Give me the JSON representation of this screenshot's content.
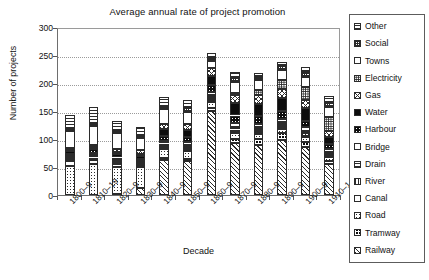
{
  "chart_data": {
    "type": "bar",
    "subtype": "stacked-bar",
    "title": "Average annual rate of project promotion",
    "xlabel": "Decade",
    "ylabel": "Number of projects",
    "ylim": [
      0,
      300
    ],
    "ytick_step": 50,
    "yticks": [
      300,
      250,
      200,
      150,
      100,
      50,
      0
    ],
    "grid": true,
    "grid_style": "dotted horizontal",
    "legend_position": "right-outside",
    "legend_order_top_to_bottom": [
      "Other",
      "Social",
      "Towns",
      "Electricity",
      "Gas",
      "Water",
      "Harbour",
      "Bridge",
      "Drain",
      "River",
      "Canal",
      "Road",
      "Tramway",
      "Railway"
    ],
    "categories": [
      "1800–9",
      "1810–19",
      "1820–9",
      "1830–9",
      "1840–9",
      "1850–9",
      "1860–9",
      "1870–9",
      "1880–9",
      "1890–9",
      "1900–9",
      "1910–14"
    ],
    "series": [
      {
        "name": "Railway",
        "pattern": "p-diag",
        "values": [
          0,
          0,
          2,
          12,
          62,
          60,
          150,
          92,
          90,
          98,
          86,
          55
        ]
      },
      {
        "name": "Tramway",
        "pattern": "p-blackgrid",
        "values": [
          0,
          0,
          0,
          0,
          4,
          5,
          6,
          8,
          10,
          12,
          9,
          6
        ]
      },
      {
        "name": "Road",
        "pattern": "p-dot",
        "values": [
          52,
          55,
          48,
          38,
          16,
          14,
          10,
          10,
          9,
          8,
          8,
          7
        ]
      },
      {
        "name": "Canal",
        "pattern": "p-white",
        "values": [
          9,
          8,
          6,
          4,
          3,
          3,
          3,
          3,
          3,
          3,
          3,
          2
        ]
      },
      {
        "name": "River",
        "pattern": "p-vline",
        "values": [
          4,
          4,
          3,
          3,
          3,
          3,
          4,
          4,
          4,
          4,
          4,
          3
        ]
      },
      {
        "name": "Drain",
        "pattern": "p-hline",
        "values": [
          4,
          4,
          4,
          3,
          4,
          4,
          5,
          5,
          5,
          5,
          5,
          4
        ]
      },
      {
        "name": "Bridge",
        "pattern": "p-white",
        "values": [
          4,
          4,
          4,
          4,
          5,
          5,
          6,
          6,
          6,
          6,
          6,
          5
        ]
      },
      {
        "name": "Harbour",
        "pattern": "p-blackdot",
        "values": [
          6,
          7,
          6,
          6,
          9,
          9,
          12,
          14,
          14,
          14,
          12,
          9
        ]
      },
      {
        "name": "Water",
        "pattern": "p-solid",
        "values": [
          3,
          4,
          4,
          4,
          11,
          13,
          17,
          23,
          22,
          24,
          22,
          13
        ]
      },
      {
        "name": "Gas",
        "pattern": "p-cross",
        "values": [
          2,
          3,
          5,
          6,
          10,
          11,
          13,
          14,
          16,
          16,
          14,
          10
        ]
      },
      {
        "name": "Electricity",
        "pattern": "p-dot-dense",
        "values": [
          0,
          0,
          0,
          0,
          0,
          0,
          0,
          4,
          9,
          16,
          24,
          26
        ]
      },
      {
        "name": "Towns",
        "pattern": "p-white",
        "values": [
          30,
          34,
          28,
          22,
          26,
          22,
          14,
          18,
          18,
          18,
          17,
          17
        ]
      },
      {
        "name": "Social",
        "pattern": "p-grid-dense",
        "values": [
          3,
          4,
          4,
          3,
          5,
          6,
          5,
          8,
          5,
          6,
          9,
          8
        ]
      },
      {
        "name": "Other",
        "pattern": "p-hline",
        "values": [
          26,
          30,
          19,
          17,
          17,
          15,
          9,
          10,
          7,
          8,
          9,
          11
        ]
      }
    ],
    "totals": [
      143,
      157,
      133,
      122,
      175,
      170,
      254,
      219,
      218,
      238,
      228,
      176
    ]
  },
  "legend": {
    "items": [
      {
        "label": "Other",
        "pattern": "p-hline"
      },
      {
        "label": "Social",
        "pattern": "p-grid-dense"
      },
      {
        "label": "Towns",
        "pattern": "p-white"
      },
      {
        "label": "Electricity",
        "pattern": "p-dot-dense"
      },
      {
        "label": "Gas",
        "pattern": "p-cross"
      },
      {
        "label": "Water",
        "pattern": "p-solid"
      },
      {
        "label": "Harbour",
        "pattern": "p-blackdot"
      },
      {
        "label": "Bridge",
        "pattern": "p-white"
      },
      {
        "label": "Drain",
        "pattern": "p-hline"
      },
      {
        "label": "River",
        "pattern": "p-vline"
      },
      {
        "label": "Canal",
        "pattern": "p-white"
      },
      {
        "label": "Road",
        "pattern": "p-dot"
      },
      {
        "label": "Tramway",
        "pattern": "p-blackgrid"
      },
      {
        "label": "Railway",
        "pattern": "p-diag"
      }
    ]
  },
  "colors": {
    "background": "#ffffff",
    "ink": "#1a1a1a",
    "axis": "#5c5c5c",
    "gridline": "#9b9b9b",
    "segment_border": "#2b2b2b",
    "fill_black": "#0c0c0c",
    "fill_white": "#ffffff"
  }
}
